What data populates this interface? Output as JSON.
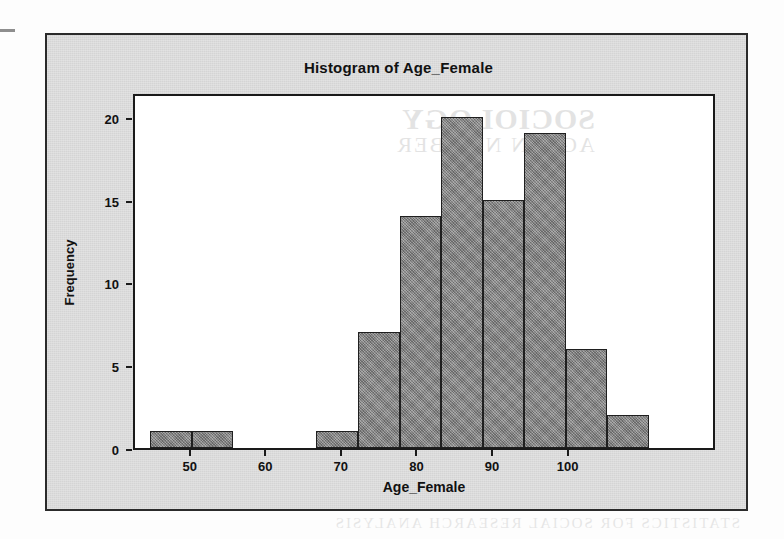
{
  "figure": {
    "title": "Histogram of Age_Female",
    "background_color": "#d4d4d4",
    "plot_background_color": "#ffffff",
    "border_color": "#2b2b2b",
    "bar_fill_color": "#8b8b8b",
    "bar_edge_color": "#1f1f1f"
  },
  "scan_artifacts": {
    "plot_bleed_line1": "SOCIOLOGY",
    "plot_bleed_line2": "AGE IN NUMBER",
    "bottom_bleed": "STATISTICS FOR SOCIAL RESEARCH ANALYSIS"
  },
  "chart_data": {
    "type": "bar",
    "title": "Histogram of Age_Female",
    "xlabel": "Age_Female",
    "ylabel": "Frequency",
    "xlim": [
      42.5,
      119.5
    ],
    "ylim": [
      0,
      21.5
    ],
    "xticks": [
      50,
      60,
      70,
      80,
      90,
      100
    ],
    "yticks": [
      0,
      5,
      10,
      15,
      20
    ],
    "grid": false,
    "legend": false,
    "bin_width": 5.5,
    "bin_starts": [
      44.5,
      50.0,
      55.5,
      61.0,
      66.5,
      72.0,
      77.5,
      83.0,
      88.5,
      94.0,
      99.5,
      105.0,
      110.5
    ],
    "bins": [
      {
        "start": 44.5,
        "end": 50.0,
        "frequency": 1
      },
      {
        "start": 50.0,
        "end": 55.5,
        "frequency": 1
      },
      {
        "start": 55.5,
        "end": 61.0,
        "frequency": 0
      },
      {
        "start": 61.0,
        "end": 66.5,
        "frequency": 0
      },
      {
        "start": 66.5,
        "end": 72.0,
        "frequency": 1
      },
      {
        "start": 72.0,
        "end": 77.5,
        "frequency": 7
      },
      {
        "start": 77.5,
        "end": 83.0,
        "frequency": 14
      },
      {
        "start": 83.0,
        "end": 88.5,
        "frequency": 20
      },
      {
        "start": 88.5,
        "end": 94.0,
        "frequency": 15
      },
      {
        "start": 94.0,
        "end": 99.5,
        "frequency": 19
      },
      {
        "start": 99.5,
        "end": 105.0,
        "frequency": 6
      },
      {
        "start": 105.0,
        "end": 110.5,
        "frequency": 2
      }
    ],
    "values": [
      1,
      1,
      0,
      0,
      1,
      7,
      14,
      20,
      15,
      19,
      6,
      2
    ],
    "categories": [
      "44.5-50",
      "50-55.5",
      "55.5-61",
      "61-66.5",
      "66.5-72",
      "72-77.5",
      "77.5-83",
      "83-88.5",
      "88.5-94",
      "94-99.5",
      "99.5-105",
      "105-110.5"
    ]
  }
}
